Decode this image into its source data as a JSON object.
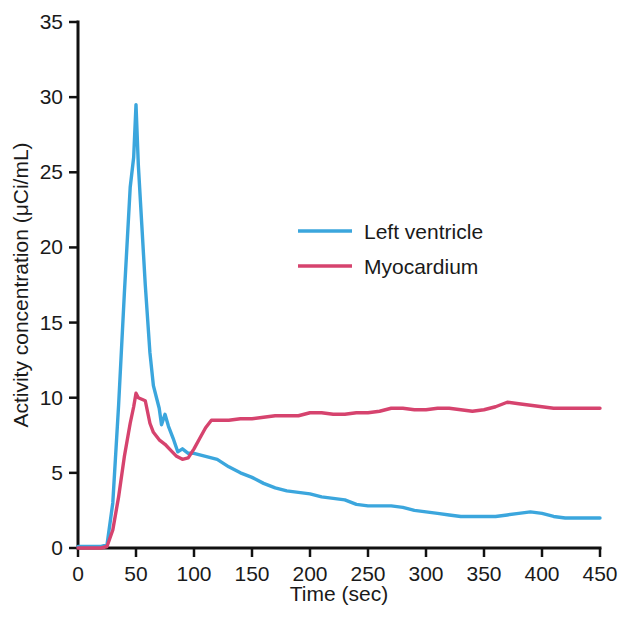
{
  "chart_data": {
    "type": "line",
    "title": "",
    "xlabel": "Time (sec)",
    "ylabel": "Activity concentration (μCi/mL)",
    "xlim": [
      0,
      450
    ],
    "ylim": [
      0,
      35
    ],
    "xticks": [
      0,
      50,
      100,
      150,
      200,
      250,
      300,
      350,
      400,
      450
    ],
    "yticks": [
      0,
      5,
      10,
      15,
      20,
      25,
      30,
      35
    ],
    "xtick_labels": [
      "0",
      "50",
      "100",
      "150",
      "200",
      "250",
      "300",
      "350",
      "400",
      "450"
    ],
    "ytick_labels": [
      "0",
      "5",
      "10",
      "15",
      "20",
      "25",
      "30",
      "35"
    ],
    "grid": false,
    "legend_position": "upper-center-right",
    "series": [
      {
        "name": "Left ventricle",
        "color": "#3ba6dd",
        "x": [
          0,
          5,
          10,
          15,
          20,
          25,
          30,
          35,
          40,
          45,
          48,
          50,
          52,
          55,
          58,
          62,
          65,
          68,
          70,
          72,
          75,
          78,
          82,
          86,
          90,
          95,
          100,
          105,
          110,
          120,
          130,
          140,
          150,
          160,
          170,
          180,
          190,
          200,
          210,
          220,
          230,
          240,
          250,
          260,
          270,
          280,
          290,
          300,
          310,
          320,
          330,
          340,
          350,
          360,
          370,
          380,
          390,
          400,
          410,
          420,
          430,
          440,
          450
        ],
        "y": [
          0.1,
          0.1,
          0.1,
          0.1,
          0.1,
          0.2,
          3.0,
          9.5,
          17.0,
          24.0,
          26.0,
          29.5,
          25.5,
          21.5,
          17.5,
          13.0,
          10.8,
          9.9,
          9.3,
          8.2,
          8.9,
          8.1,
          7.3,
          6.4,
          6.6,
          6.3,
          6.3,
          6.2,
          6.1,
          5.9,
          5.4,
          5.0,
          4.7,
          4.3,
          4.0,
          3.8,
          3.7,
          3.6,
          3.4,
          3.3,
          3.2,
          2.9,
          2.8,
          2.8,
          2.8,
          2.7,
          2.5,
          2.4,
          2.3,
          2.2,
          2.1,
          2.1,
          2.1,
          2.1,
          2.2,
          2.3,
          2.4,
          2.3,
          2.1,
          2.0,
          2.0,
          2.0,
          2.0
        ]
      },
      {
        "name": "Myocardium",
        "color": "#d6436e",
        "x": [
          0,
          5,
          10,
          15,
          20,
          25,
          30,
          35,
          40,
          45,
          48,
          50,
          52,
          55,
          58,
          62,
          65,
          70,
          75,
          80,
          85,
          90,
          95,
          100,
          105,
          110,
          115,
          120,
          130,
          140,
          150,
          160,
          170,
          180,
          190,
          200,
          210,
          220,
          230,
          240,
          250,
          260,
          270,
          280,
          290,
          300,
          310,
          320,
          330,
          340,
          350,
          360,
          370,
          380,
          390,
          400,
          410,
          420,
          430,
          440,
          450
        ],
        "y": [
          0.0,
          0.0,
          0.0,
          0.0,
          0.0,
          0.1,
          1.2,
          3.4,
          6.1,
          8.3,
          9.4,
          10.3,
          10.0,
          9.9,
          9.8,
          8.3,
          7.7,
          7.2,
          6.9,
          6.5,
          6.1,
          5.9,
          6.0,
          6.6,
          7.3,
          8.0,
          8.5,
          8.5,
          8.5,
          8.6,
          8.6,
          8.7,
          8.8,
          8.8,
          8.8,
          9.0,
          9.0,
          8.9,
          8.9,
          9.0,
          9.0,
          9.1,
          9.3,
          9.3,
          9.2,
          9.2,
          9.3,
          9.3,
          9.2,
          9.1,
          9.2,
          9.4,
          9.7,
          9.6,
          9.5,
          9.4,
          9.3,
          9.3,
          9.3,
          9.3,
          9.3
        ]
      }
    ]
  },
  "legend": {
    "entries": [
      {
        "label": "Left ventricle",
        "color": "#3ba6dd"
      },
      {
        "label": "Myocardium",
        "color": "#d6436e"
      }
    ]
  },
  "axes": {
    "x_title": "Time (sec)",
    "y_title": "Activity concentration (μCi/mL)"
  }
}
